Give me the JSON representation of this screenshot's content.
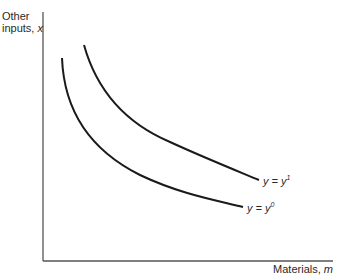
{
  "axes": {
    "y_label_line1": "Other",
    "y_label_line2": "inputs, ",
    "y_label_var": "x",
    "x_label": "Materials, ",
    "x_label_var": "m"
  },
  "curves": [
    {
      "name": "isoquant-y0",
      "label_lhs": "y = y",
      "label_sup": "0",
      "color": "#1a1a1a"
    },
    {
      "name": "isoquant-y1",
      "label_lhs": "y = y",
      "label_sup": "1",
      "color": "#1a1a1a"
    }
  ],
  "colors": {
    "axis": "#555555",
    "curve": "#1a1a1a",
    "text": "#2a2a2a"
  }
}
